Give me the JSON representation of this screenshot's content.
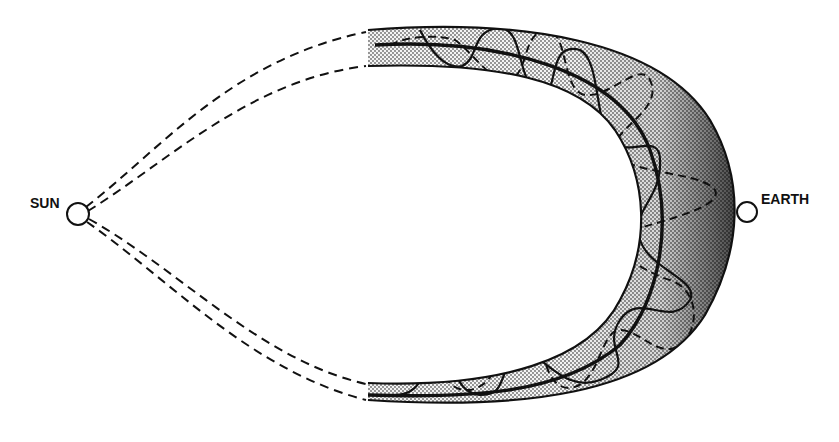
{
  "diagram": {
    "type": "magnetic cloud / flux rope schematic",
    "labels": {
      "sun": "SUN",
      "earth": "EARTH"
    },
    "bodies": [
      {
        "name": "sun",
        "shape": "circle",
        "cx": 78,
        "cy": 214,
        "r": 11
      },
      {
        "name": "earth",
        "shape": "circle",
        "cx": 747,
        "cy": 212,
        "r": 10
      }
    ],
    "structures": [
      {
        "name": "flux-rope-band",
        "fill": "stippled gray, darker toward Earth side"
      },
      {
        "name": "footpoint-legs",
        "style": "dashed",
        "count": 4,
        "connects": "sun to band ends"
      },
      {
        "name": "helical-field-lines",
        "style": "solid and dashed",
        "description": "twisted lines wrapping around the band axis"
      },
      {
        "name": "band-axis",
        "style": "thick solid"
      }
    ],
    "colors": {
      "background": "#ffffff",
      "ink": "#111111",
      "stipple_light": "#c9c9c9",
      "stipple_dark": "#555555"
    }
  }
}
